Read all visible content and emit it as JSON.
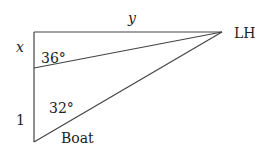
{
  "diagram": {
    "type": "right-triangle-geometry",
    "colors": {
      "stroke": "#444444",
      "text": "#222222",
      "background": "#ffffff"
    },
    "labels": {
      "side_top": "y",
      "side_left_upper": "x",
      "side_left_lower": "1",
      "vertex_right": "LH",
      "vertex_bottom": "Boat",
      "angle_upper": "36°",
      "angle_lower": "32°"
    },
    "points": {
      "top_left": [
        34,
        32
      ],
      "lighthouse": [
        222,
        32
      ],
      "mid_left": [
        34,
        68
      ],
      "boat": [
        34,
        142
      ]
    }
  }
}
